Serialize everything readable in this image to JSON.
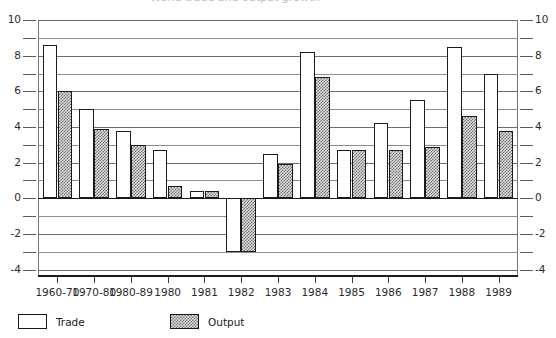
{
  "title_sliver": "World trade and output growth",
  "legend": {
    "position": "bottom-left",
    "items": [
      {
        "label": "Trade",
        "key": "trade",
        "pattern": "hollow-white"
      },
      {
        "label": "Output",
        "key": "output",
        "pattern": "stipple-hatch"
      }
    ]
  },
  "axis": {
    "y_left_labels": [
      "10",
      "8",
      "6",
      "4",
      "2",
      "0",
      "-2",
      "-4"
    ],
    "y_right_labels": [
      "10",
      "8",
      "6",
      "4",
      "2",
      "0",
      "-2",
      "-4"
    ],
    "y_label_values": [
      10,
      8,
      6,
      4,
      2,
      0,
      -2,
      -4
    ],
    "minor_gridline_values": [
      9,
      7,
      5,
      3,
      1,
      -1,
      -3
    ],
    "ylim": [
      -4.3,
      10
    ],
    "grid": true
  },
  "chart_data": {
    "type": "bar",
    "title": "World trade and output growth",
    "xlabel": "",
    "ylabel": "",
    "ylim": [
      -4.3,
      10
    ],
    "grid": true,
    "legend_position": "bottom-left",
    "categories": [
      "1960-70",
      "1970-80",
      "1980-89",
      "1980",
      "1981",
      "1982",
      "1983",
      "1984",
      "1985",
      "1986",
      "1987",
      "1988",
      "1989"
    ],
    "series": [
      {
        "name": "Trade",
        "values": [
          8.6,
          5.0,
          3.8,
          2.7,
          0.4,
          -3.0,
          2.5,
          8.2,
          2.7,
          4.2,
          5.5,
          8.5,
          7.0
        ]
      },
      {
        "name": "Output",
        "values": [
          6.0,
          3.9,
          3.0,
          0.7,
          0.4,
          -3.0,
          1.9,
          6.8,
          2.7,
          2.7,
          2.9,
          4.6,
          3.8
        ]
      }
    ]
  },
  "colors": {
    "trade_fill": "#ffffff",
    "output_fill": "#dedede",
    "bar_stroke": "#1b1b1b",
    "gridline": "#8d8d8d",
    "zero_line": "#1a1a1a",
    "text": "#2b2b2b"
  }
}
